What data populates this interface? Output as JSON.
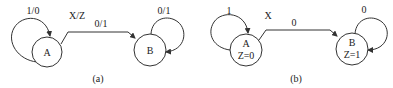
{
  "diagrams": [
    {
      "caption": "(a)",
      "type": "mealy-state-diagram",
      "legend_label": "X/Z",
      "states": [
        {
          "name": "A",
          "output": ""
        },
        {
          "name": "B",
          "output": ""
        }
      ],
      "transitions": [
        {
          "from": "A",
          "to": "A",
          "label": "1/0"
        },
        {
          "from": "A",
          "to": "B",
          "label": "0/1"
        },
        {
          "from": "B",
          "to": "B",
          "label": "0/1"
        }
      ]
    },
    {
      "caption": "(b)",
      "type": "moore-state-diagram",
      "legend_label": "X",
      "states": [
        {
          "name": "A",
          "output": "Z=0"
        },
        {
          "name": "B",
          "output": "Z=1"
        }
      ],
      "transitions": [
        {
          "from": "A",
          "to": "A",
          "label": "1"
        },
        {
          "from": "A",
          "to": "B",
          "label": "0"
        },
        {
          "from": "B",
          "to": "B",
          "label": "0"
        }
      ]
    }
  ],
  "colors": {
    "stroke": "#333333",
    "text": "#222222",
    "background": "#ffffff"
  }
}
